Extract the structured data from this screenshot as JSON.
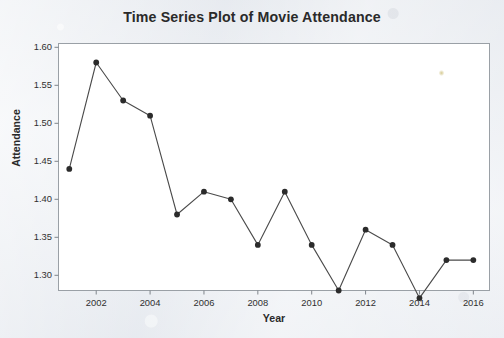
{
  "chart_data": {
    "type": "line",
    "title": "Time Series Plot of Movie Attendance",
    "xlabel": "Year",
    "ylabel": "Attendance",
    "x": [
      2001,
      2002,
      2003,
      2004,
      2005,
      2006,
      2007,
      2008,
      2009,
      2010,
      2011,
      2012,
      2013,
      2014,
      2015,
      2016
    ],
    "values": [
      1.44,
      1.58,
      1.53,
      1.51,
      1.38,
      1.41,
      1.4,
      1.34,
      1.41,
      1.34,
      1.28,
      1.36,
      1.34,
      1.27,
      1.32,
      1.32
    ],
    "xlim": [
      2000.6,
      2016.6
    ],
    "ylim": [
      1.28,
      1.605
    ],
    "xticks": [
      2002,
      2004,
      2006,
      2008,
      2010,
      2012,
      2014,
      2016
    ],
    "xtick_labels": [
      "2002",
      "2004",
      "2006",
      "2008",
      "2010",
      "2012",
      "2014",
      "2016"
    ],
    "yticks": [
      1.3,
      1.35,
      1.4,
      1.45,
      1.5,
      1.55,
      1.6
    ],
    "ytick_labels": [
      "1.30",
      "1.35",
      "1.40",
      "1.45",
      "1.50",
      "1.55",
      "1.60"
    ],
    "grid": false,
    "legend": null,
    "marker": "filled-circle",
    "line_color": "#4a4a4a",
    "marker_color": "#2b2b2b",
    "plot_background": "#ffffff",
    "frame_color": "#9aa0a6"
  },
  "page": {
    "background_color": "#e8ebef"
  }
}
